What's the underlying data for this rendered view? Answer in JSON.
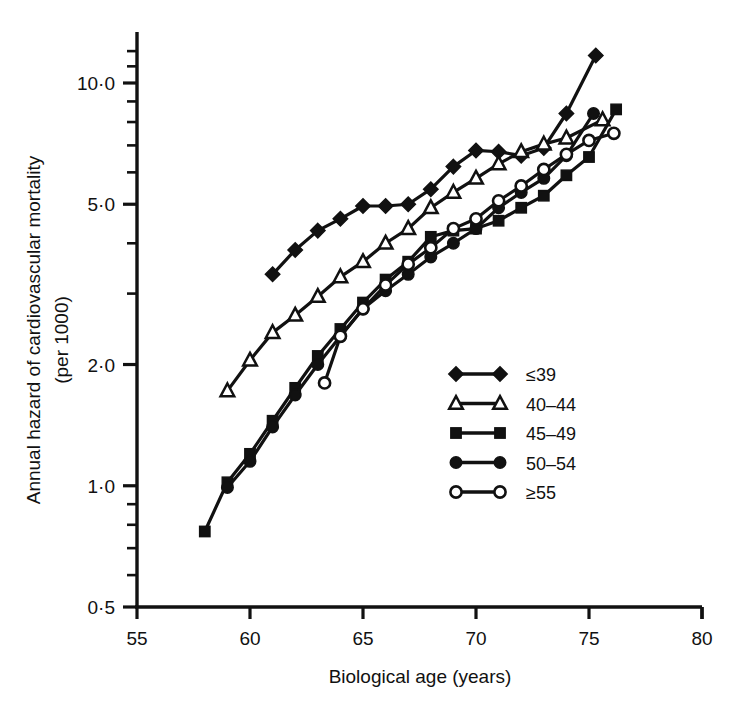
{
  "chart_data": {
    "type": "line",
    "title": "",
    "xlabel": "Biological age (years)",
    "ylabel_line1": "Annual hazard of cardiovascular mortality",
    "ylabel_line2": "(per 1000)",
    "xlim": [
      55,
      80
    ],
    "ylim": [
      0.5,
      12.5
    ],
    "yscale": "log",
    "xscale": "linear",
    "grid": false,
    "legend_position": "right-middle",
    "xticks": [
      55,
      60,
      65,
      70,
      75,
      80
    ],
    "xticklabels": [
      "55",
      "60",
      "65",
      "70",
      "75",
      "80"
    ],
    "yticks": [
      0.5,
      1.0,
      2.0,
      5.0,
      10.0
    ],
    "yticklabels": [
      "0·5",
      "1·0",
      "2·0",
      "5·0",
      "10·0"
    ],
    "yminorticks": [
      0.6,
      0.7,
      0.8,
      0.9,
      3.0,
      4.0,
      6.0,
      7.0,
      8.0,
      9.0,
      11.0,
      12.0
    ],
    "series": [
      {
        "name": "≤39",
        "marker": "filled-diamond",
        "x": [
          61,
          62,
          63,
          64,
          65,
          66,
          67,
          68,
          69,
          70,
          71,
          72,
          73,
          74,
          75.3
        ],
        "y": [
          3.35,
          3.85,
          4.3,
          4.6,
          4.95,
          4.95,
          5.0,
          5.45,
          6.2,
          6.8,
          6.75,
          6.6,
          6.9,
          8.4,
          11.7
        ]
      },
      {
        "name": "40–44",
        "marker": "open-triangle",
        "x": [
          59,
          60,
          61,
          62,
          63,
          64,
          65,
          66,
          67,
          68,
          69,
          70,
          71,
          72,
          73,
          74,
          75.6
        ],
        "y": [
          1.72,
          2.05,
          2.4,
          2.65,
          2.95,
          3.3,
          3.6,
          4.0,
          4.35,
          4.9,
          5.35,
          5.8,
          6.3,
          6.75,
          7.05,
          7.3,
          8.1
        ]
      },
      {
        "name": "45–49",
        "marker": "filled-square",
        "x": [
          58,
          59,
          60,
          61,
          62,
          63,
          64,
          65,
          66,
          67,
          68,
          69,
          70,
          71,
          72,
          73,
          74,
          75,
          76.2
        ],
        "y": [
          0.77,
          1.02,
          1.2,
          1.45,
          1.75,
          2.1,
          2.45,
          2.85,
          3.25,
          3.6,
          4.15,
          4.3,
          4.35,
          4.55,
          4.9,
          5.25,
          5.9,
          6.55,
          8.6
        ]
      },
      {
        "name": "50–54",
        "marker": "filled-circle",
        "x": [
          59,
          60,
          61,
          62,
          63,
          64,
          65,
          66,
          67,
          68,
          69,
          70,
          71,
          72,
          73,
          74,
          75.2
        ],
        "y": [
          0.99,
          1.15,
          1.4,
          1.68,
          2.0,
          2.35,
          2.75,
          3.05,
          3.35,
          3.7,
          4.0,
          4.35,
          4.9,
          5.35,
          5.8,
          6.6,
          8.4
        ]
      },
      {
        "name": "≥55",
        "marker": "open-circle",
        "x": [
          63.3,
          64,
          65,
          66,
          67,
          68,
          69,
          70,
          71,
          72,
          73,
          74,
          75,
          76.1
        ],
        "y": [
          1.8,
          2.35,
          2.75,
          3.15,
          3.55,
          3.9,
          4.35,
          4.6,
          5.1,
          5.55,
          6.1,
          6.65,
          7.2,
          7.5
        ]
      }
    ]
  },
  "legend": {
    "entries": [
      {
        "label": "≤39",
        "marker": "filled-diamond"
      },
      {
        "label": "40–44",
        "marker": "open-triangle"
      },
      {
        "label": "45–49",
        "marker": "filled-square"
      },
      {
        "label": "50–54",
        "marker": "filled-circle"
      },
      {
        "label": "≥55",
        "marker": "open-circle"
      }
    ]
  },
  "colors": {
    "ink": "#111111",
    "background": "#ffffff"
  }
}
